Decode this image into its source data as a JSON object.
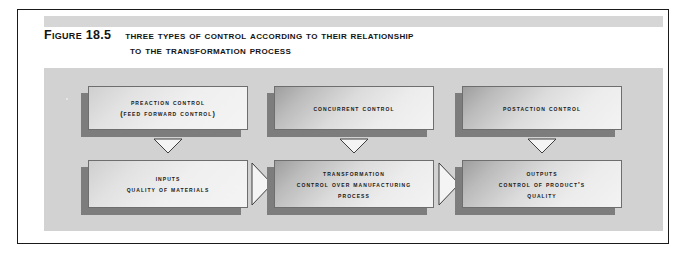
{
  "figure": {
    "label": "Figure 18.5",
    "title_line1": "Three Types of Control According to Their Relationship",
    "title_line2": "to the Transformation Process"
  },
  "diagram": {
    "top_row": [
      {
        "id": "preaction-control",
        "lines": [
          "Preaction Control",
          "(Feed Forward Control)"
        ]
      },
      {
        "id": "concurrent-control",
        "lines": [
          "Concurrent Control"
        ]
      },
      {
        "id": "postaction-control",
        "lines": [
          "Postaction Control"
        ]
      }
    ],
    "bottom_row": [
      {
        "id": "inputs",
        "lines": [
          "Inputs",
          "Quality of Materials"
        ]
      },
      {
        "id": "transformation",
        "lines": [
          "Transformation",
          "Control over manufacturing",
          "process"
        ]
      },
      {
        "id": "outputs",
        "lines": [
          "Outputs",
          "Control of product's",
          "quality"
        ]
      }
    ],
    "down_arrows": [
      {
        "id": "arrow-preaction-to-inputs"
      },
      {
        "id": "arrow-concurrent-to-transformation"
      },
      {
        "id": "arrow-postaction-to-outputs"
      }
    ],
    "flow_arrows": [
      {
        "id": "arrow-inputs-to-transformation"
      },
      {
        "id": "arrow-transformation-to-outputs"
      }
    ]
  },
  "colors": {
    "frame": "#1a1a1a",
    "panel_background": "#d2d2d2",
    "title_band": "#d6d6d6",
    "box_border": "#6e6e6e",
    "box_shadow": "#7d7d7d",
    "text": "#141414",
    "arrow_fill": "#f2f2f2",
    "arrow_stroke": "#4a4a4a"
  }
}
